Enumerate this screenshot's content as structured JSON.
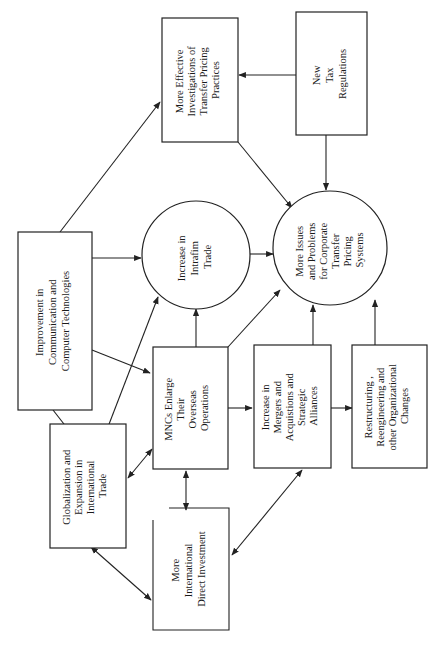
{
  "diagram": {
    "orientation": "rotated-90-ccw",
    "nodes": {
      "improvement": {
        "shape": "rect",
        "lines": [
          "Improvement in",
          "Communication and",
          "Computer Technologies"
        ]
      },
      "globalization": {
        "shape": "rect",
        "lines": [
          "Globalization and",
          "Expansion in",
          "International",
          "Trade"
        ]
      },
      "direct_investment": {
        "shape": "rect",
        "lines": [
          "More",
          "International",
          "Direct Investment"
        ]
      },
      "mncs": {
        "shape": "rect",
        "lines": [
          "MNCs Enlarge",
          "Their",
          "Overseas",
          "Operations"
        ]
      },
      "intrafirm": {
        "shape": "circle",
        "lines": [
          "Increase in",
          "Intrafim",
          "Trade"
        ]
      },
      "investigations": {
        "shape": "rect",
        "lines": [
          "More  Effective",
          "Investigations of",
          "Transfer Pricing",
          "Practices"
        ]
      },
      "tax": {
        "shape": "rect",
        "lines": [
          "New",
          "Tax",
          "Regulations"
        ]
      },
      "issues": {
        "shape": "circle",
        "lines": [
          "More Issues",
          "and Problems",
          "for Corporate",
          "Transfer",
          "Pricing",
          "Systems"
        ]
      },
      "mergers": {
        "shape": "rect",
        "lines": [
          "Increase in",
          "Mergers and",
          "Acquistions and",
          "Strategic",
          "Alliances"
        ]
      },
      "restructuring": {
        "shape": "rect",
        "lines": [
          "Restructuring ,",
          "Reengineering and",
          "other Organizational",
          "Changes"
        ]
      }
    },
    "edges": [
      {
        "from": "improvement",
        "to": "investigations",
        "type": "arrow"
      },
      {
        "from": "improvement",
        "to": "intrafirm",
        "type": "arrow"
      },
      {
        "from": "improvement",
        "to": "mncs",
        "type": "arrow"
      },
      {
        "from": "improvement",
        "to": "globalization",
        "type": "arrow"
      },
      {
        "from": "globalization",
        "to": "intrafirm",
        "type": "arrow"
      },
      {
        "from": "globalization",
        "to": "mncs",
        "type": "bidirectional"
      },
      {
        "from": "globalization",
        "to": "direct_investment",
        "type": "bidirectional"
      },
      {
        "from": "mncs",
        "to": "direct_investment",
        "type": "bidirectional"
      },
      {
        "from": "mncs",
        "to": "intrafirm",
        "type": "arrow"
      },
      {
        "from": "mncs",
        "to": "issues",
        "type": "arrow"
      },
      {
        "from": "mncs",
        "to": "mergers",
        "type": "arrow"
      },
      {
        "from": "intrafirm",
        "to": "issues",
        "type": "arrow"
      },
      {
        "from": "investigations",
        "to": "issues",
        "type": "arrow"
      },
      {
        "from": "tax",
        "to": "investigations",
        "type": "arrow"
      },
      {
        "from": "tax",
        "to": "issues",
        "type": "arrow"
      },
      {
        "from": "mergers",
        "to": "issues",
        "type": "arrow"
      },
      {
        "from": "mergers",
        "to": "restructuring",
        "type": "arrow"
      },
      {
        "from": "mergers",
        "to": "direct_investment",
        "type": "bidirectional"
      },
      {
        "from": "restructuring",
        "to": "issues",
        "type": "arrow"
      }
    ]
  }
}
